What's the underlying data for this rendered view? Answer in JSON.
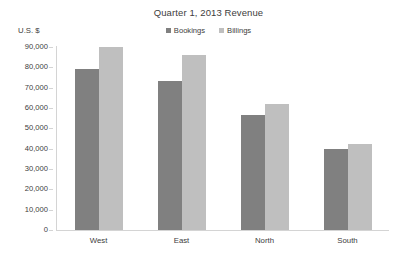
{
  "chart_data": {
    "type": "bar",
    "title": "Quarter 1, 2013 Revenue",
    "xlabel": "",
    "ylabel": "U.S. $",
    "categories": [
      "West",
      "East",
      "North",
      "South"
    ],
    "series": [
      {
        "name": "Bookings",
        "color": "#808080",
        "values": [
          79000,
          73500,
          56500,
          40000
        ]
      },
      {
        "name": "Billings",
        "color": "#bfbfbf",
        "values": [
          90000,
          86000,
          62000,
          42500
        ]
      }
    ],
    "ylim": [
      0,
      90000
    ],
    "y_tick_step": 10000,
    "y_tick_labels": [
      "90,000",
      "80,000",
      "70,000",
      "60,000",
      "50,000",
      "40,000",
      "30,000",
      "20,000",
      "10,000",
      "0"
    ],
    "y_tick_values": [
      90000,
      80000,
      70000,
      60000,
      50000,
      40000,
      30000,
      20000,
      10000,
      0
    ],
    "grid": false,
    "legend_position": "top-center",
    "axis_color": "#d4d4d4",
    "background": "#ffffff"
  }
}
